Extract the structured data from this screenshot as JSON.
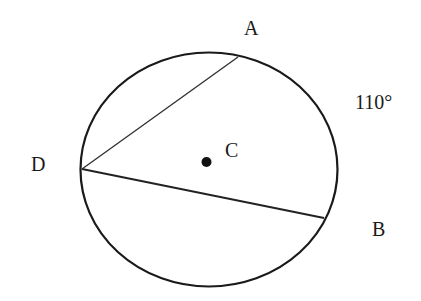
{
  "diagram": {
    "type": "circle-geometry",
    "points": [
      {
        "id": "A",
        "label": "A"
      },
      {
        "id": "B",
        "label": "B"
      },
      {
        "id": "C",
        "label": "C"
      },
      {
        "id": "D",
        "label": "D"
      }
    ],
    "chords": [
      "DA",
      "DB"
    ],
    "center": "C",
    "arc_label": "110°",
    "colors": {
      "stroke": "#1a1a1a",
      "background": "#ffffff"
    }
  }
}
